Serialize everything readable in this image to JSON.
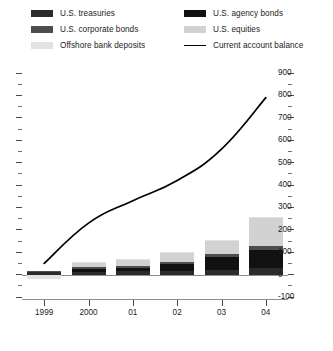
{
  "legend": {
    "columns": [
      {
        "items": [
          {
            "label": "U.S. treasuries",
            "color": "#2b2b2b",
            "type": "swatch"
          },
          {
            "label": "U.S. corporate bonds",
            "color": "#4d4d4d",
            "type": "swatch"
          },
          {
            "label": "Offshore bank deposits",
            "color": "#e2e2e2",
            "type": "swatch"
          }
        ]
      },
      {
        "items": [
          {
            "label": "U.S. agency bonds",
            "color": "#111111",
            "type": "swatch"
          },
          {
            "label": "U.S. equities",
            "color": "#d2d2d2",
            "type": "swatch"
          },
          {
            "label": "Current account balance",
            "color": "#000000",
            "type": "line"
          }
        ]
      }
    ]
  },
  "axes": {
    "right_ticks": [
      "900",
      "800",
      "700",
      "600",
      "500",
      "400",
      "300",
      "200",
      "100",
      "0",
      "-100"
    ],
    "x_labels": [
      "1999",
      "2000",
      "01",
      "02",
      "03",
      "04"
    ]
  },
  "chart_data": {
    "type": "bar",
    "title": "",
    "subtitle": "",
    "xlabel": "",
    "ylabel": "",
    "ylim": [
      -100,
      900
    ],
    "ytick_step": 100,
    "yminor_step": 50,
    "grid": false,
    "legend_position": "top",
    "categories": [
      "1999",
      "2000",
      "01",
      "02",
      "03",
      "04"
    ],
    "stacked": true,
    "series": [
      {
        "name": "U.S. treasuries",
        "color": "#2b2b2b",
        "values": [
          10,
          12,
          14,
          18,
          22,
          30
        ]
      },
      {
        "name": "U.S. agency bonds",
        "color": "#111111",
        "values": [
          4,
          14,
          16,
          30,
          58,
          80
        ]
      },
      {
        "name": "U.S. corporate bonds",
        "color": "#4d4d4d",
        "values": [
          2,
          6,
          8,
          10,
          12,
          18
        ]
      },
      {
        "name": "U.S. equities",
        "color": "#d2d2d2",
        "values": [
          0,
          22,
          30,
          40,
          60,
          125
        ]
      },
      {
        "name": "Offshore bank deposits",
        "color": "#e2e2e2",
        "values": [
          -18,
          2,
          2,
          2,
          3,
          2
        ]
      }
    ],
    "overlay_line": {
      "name": "Current account balance",
      "color": "#000000",
      "axis": "right",
      "x": [
        "1999",
        "2000",
        "01",
        "02",
        "03",
        "04"
      ],
      "values": [
        50,
        230,
        330,
        420,
        560,
        790
      ]
    }
  }
}
